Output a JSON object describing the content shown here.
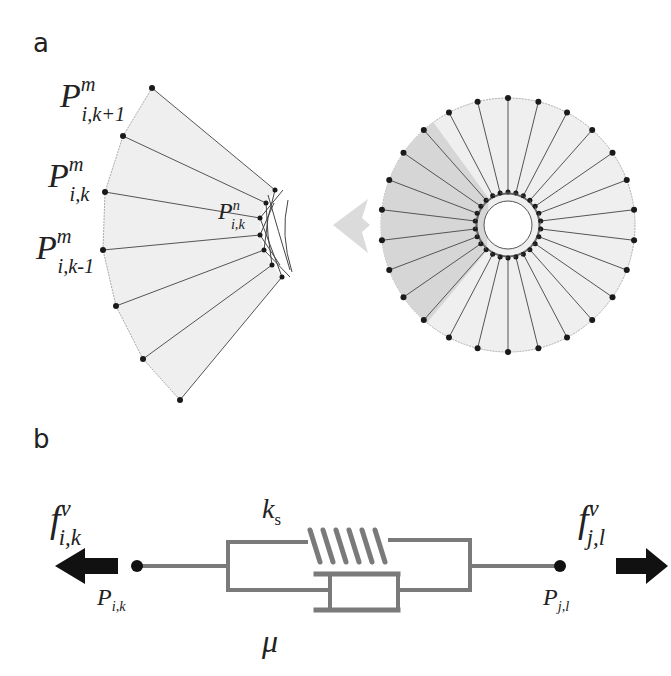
{
  "panels": {
    "a": {
      "label": "a",
      "left_labels": [
        {
          "base": "P",
          "sup": "m",
          "sub": "i,k+1"
        },
        {
          "base": "P",
          "sup": "m",
          "sub": "i,k"
        },
        {
          "base": "P",
          "sup": "m",
          "sub": "i,k-1"
        }
      ],
      "inner_label": {
        "base": "P",
        "sup": "n",
        "sub": "i,k"
      },
      "circle": {
        "spokes": 26,
        "highlight_color": "#d8d8d8"
      },
      "arrow_direction": "left"
    },
    "b": {
      "label": "b",
      "spring_label": {
        "base": "k",
        "sub": "s"
      },
      "damper_label": "μ",
      "left_force": {
        "base": "f",
        "sup": "v",
        "sub": "i,k"
      },
      "right_force": {
        "base": "f",
        "sup": "v",
        "sub": "j,l"
      },
      "left_point": {
        "base": "P",
        "sub": "i,k"
      },
      "right_point": {
        "base": "P",
        "sub": "j,l"
      }
    }
  },
  "colors": {
    "line": "#555555",
    "element": "#7a7a7a",
    "dot": "#1a1a1a",
    "fill": "#efefef",
    "shade": "#d6d6d6"
  }
}
